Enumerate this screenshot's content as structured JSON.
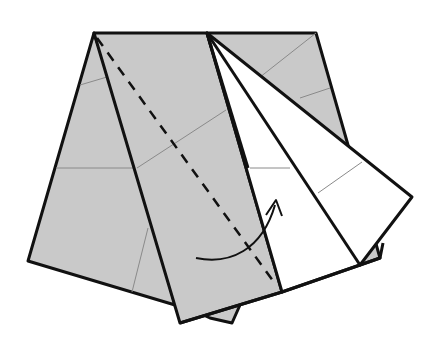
{
  "diagram": {
    "type": "origami-fold-step",
    "colors": {
      "paper_colored": "#c9c9c9",
      "paper_white": "#ffffff",
      "outline": "#111111",
      "crease": "#8a8a8a"
    },
    "annotations": [
      {
        "kind": "valley-fold-line",
        "style": "dashed"
      },
      {
        "kind": "fold-direction-arrow",
        "direction": "to-right"
      }
    ]
  }
}
